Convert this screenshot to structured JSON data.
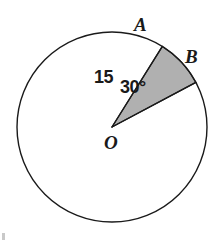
{
  "figure": {
    "type": "circle-sector-diagram",
    "background_color": "#ffffff",
    "stroke_color": "#1a1a1a",
    "sector_fill_color": "#b0b0b0",
    "circle": {
      "center_label": "O",
      "center_x": 112,
      "center_y": 127,
      "radius_px": 95,
      "stroke_width": 1.3
    },
    "sector": {
      "start_point_label": "A",
      "end_point_label": "B",
      "central_angle_deg": 30,
      "start_angle_deg": 58,
      "end_angle_deg": 28
    },
    "labels": {
      "point_a": "A",
      "point_b": "B",
      "center": "O",
      "radius": "15",
      "angle": "30°"
    }
  },
  "chart_data": {
    "type": "pie",
    "title": "",
    "xlabel": "",
    "ylabel": "",
    "categories": [
      "sector AOB (shaded)",
      "remainder of circle"
    ],
    "values": [
      30,
      330
    ],
    "value_unit": "degrees",
    "annotations": [
      "A",
      "B",
      "O",
      "15",
      "30°"
    ],
    "radius": 15,
    "legend_position": "none",
    "grid": false
  }
}
